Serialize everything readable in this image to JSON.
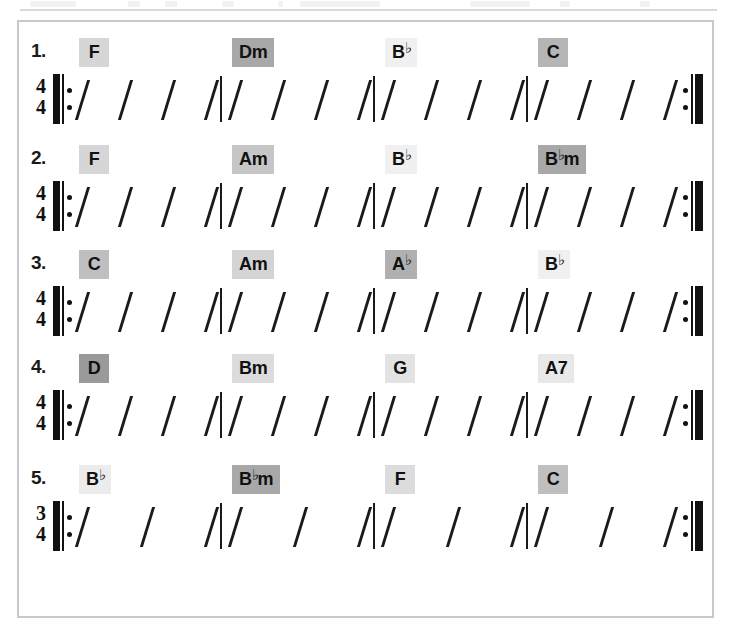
{
  "sheet": {
    "border_color": "#c9c9c9",
    "background": "#ffffff",
    "ink_color": "#1a1a1a"
  },
  "exercises": [
    {
      "number": "1.",
      "time_signature": {
        "beats": "4",
        "unit": "4"
      },
      "beats_per_measure": 4,
      "measures": 4,
      "repeat_start": true,
      "repeat_end": true,
      "chords": [
        {
          "root": "F",
          "flat": false,
          "quality": "",
          "label": "F",
          "highlight": "#d6d6d6"
        },
        {
          "root": "D",
          "flat": false,
          "quality": "m",
          "label": "Dm",
          "highlight": "#a8a8a8"
        },
        {
          "root": "B",
          "flat": true,
          "quality": "",
          "label": "B♭",
          "highlight": "#f0f0f0"
        },
        {
          "root": "C",
          "flat": false,
          "quality": "",
          "label": "C",
          "highlight": "#b5b5b5"
        }
      ]
    },
    {
      "number": "2.",
      "time_signature": {
        "beats": "4",
        "unit": "4"
      },
      "beats_per_measure": 4,
      "measures": 4,
      "repeat_start": true,
      "repeat_end": true,
      "chords": [
        {
          "root": "F",
          "flat": false,
          "quality": "",
          "label": "F",
          "highlight": "#d6d6d6"
        },
        {
          "root": "A",
          "flat": false,
          "quality": "m",
          "label": "Am",
          "highlight": "#c6c6c6"
        },
        {
          "root": "B",
          "flat": true,
          "quality": "",
          "label": "B♭",
          "highlight": "#f0f0f0"
        },
        {
          "root": "B",
          "flat": true,
          "quality": "m",
          "label": "B♭m",
          "highlight": "#a8a8a8"
        }
      ]
    },
    {
      "number": "3.",
      "time_signature": {
        "beats": "4",
        "unit": "4"
      },
      "beats_per_measure": 4,
      "measures": 4,
      "repeat_start": true,
      "repeat_end": true,
      "chords": [
        {
          "root": "C",
          "flat": false,
          "quality": "",
          "label": "C",
          "highlight": "#bfbfbf"
        },
        {
          "root": "A",
          "flat": false,
          "quality": "m",
          "label": "Am",
          "highlight": "#d4d4d4"
        },
        {
          "root": "A",
          "flat": true,
          "quality": "",
          "label": "A♭",
          "highlight": "#b0b0b0"
        },
        {
          "root": "B",
          "flat": true,
          "quality": "",
          "label": "B♭",
          "highlight": "#f0f0f0"
        }
      ]
    },
    {
      "number": "4.",
      "time_signature": {
        "beats": "4",
        "unit": "4"
      },
      "beats_per_measure": 4,
      "measures": 4,
      "repeat_start": true,
      "repeat_end": true,
      "chords": [
        {
          "root": "D",
          "flat": false,
          "quality": "",
          "label": "D",
          "highlight": "#9a9a9a"
        },
        {
          "root": "B",
          "flat": false,
          "quality": "m",
          "label": "Bm",
          "highlight": "#dcdcdc"
        },
        {
          "root": "G",
          "flat": false,
          "quality": "",
          "label": "G",
          "highlight": "#e3e3e3"
        },
        {
          "root": "A",
          "flat": false,
          "quality": "7",
          "label": "A7",
          "highlight": "#e8e8e8"
        }
      ]
    },
    {
      "number": "5.",
      "time_signature": {
        "beats": "3",
        "unit": "4"
      },
      "beats_per_measure": 3,
      "measures": 4,
      "repeat_start": true,
      "repeat_end": true,
      "chords": [
        {
          "root": "B",
          "flat": true,
          "quality": "",
          "label": "B♭",
          "highlight": "#ececec"
        },
        {
          "root": "B",
          "flat": true,
          "quality": "m",
          "label": "B♭m",
          "highlight": "#a8a8a8"
        },
        {
          "root": "F",
          "flat": false,
          "quality": "",
          "label": "F",
          "highlight": "#dcdcdc"
        },
        {
          "root": "C",
          "flat": false,
          "quality": "",
          "label": "C",
          "highlight": "#bfbfbf"
        }
      ]
    }
  ]
}
